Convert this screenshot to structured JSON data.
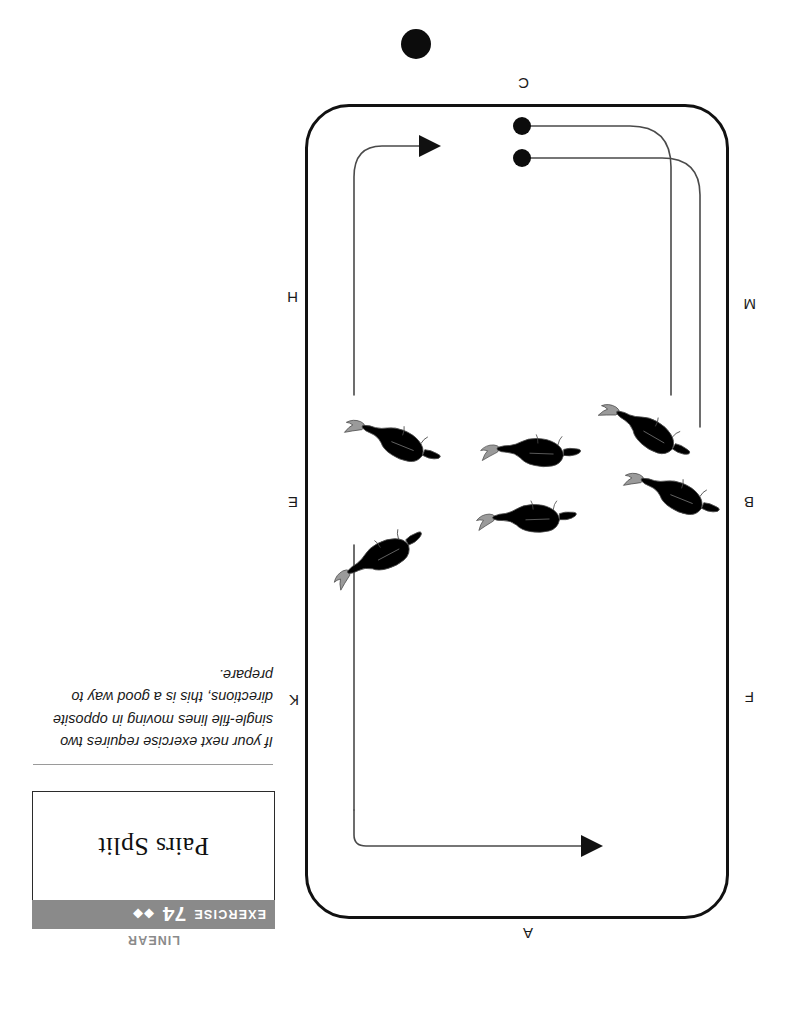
{
  "page": {
    "orientation": "rotated-180",
    "background": "#ffffff"
  },
  "header": {
    "category": "LINEAR",
    "exercise_word": "EXERCISE",
    "exercise_number": "74",
    "difficulty_diamonds": "◆◆",
    "band_color": "#8a8a8a",
    "category_color": "#8a8a8a"
  },
  "title": {
    "text": "Pairs Split"
  },
  "caption": {
    "text": "If your next exercise requires two single-file lines moving in opposite directions, this is a good way to prepare."
  },
  "arena": {
    "letters": [
      {
        "id": "A",
        "label": "A",
        "side": "top",
        "x": 253,
        "y": 74
      },
      {
        "id": "F",
        "label": "F",
        "side": "left",
        "x": 32,
        "y": 310
      },
      {
        "id": "B",
        "label": "B",
        "side": "left",
        "x": 32,
        "y": 505
      },
      {
        "id": "M",
        "label": "M",
        "side": "left",
        "x": 30,
        "y": 703
      },
      {
        "id": "K",
        "label": "K",
        "side": "right",
        "x": 487,
        "y": 307
      },
      {
        "id": "E",
        "label": "E",
        "side": "right",
        "x": 488,
        "y": 505
      },
      {
        "id": "H",
        "label": "H",
        "side": "right",
        "x": 488,
        "y": 710
      },
      {
        "id": "C",
        "label": "C",
        "side": "bottom",
        "x": 257,
        "y": 924
      }
    ],
    "border_color": "#111111"
  },
  "tracks": {
    "line_color": "#4a4a4a",
    "arrow_color": "#111111",
    "start_dot_color": "#0c0c0c",
    "arrows": [
      {
        "id": "arrow-top",
        "direction": "left",
        "x": 196,
        "y": 169
      },
      {
        "id": "arrow-bottom",
        "direction": "left",
        "x": 358,
        "y": 869
      }
    ],
    "start_dots": [
      {
        "id": "start-dot-inner",
        "x": 264,
        "y": 857
      },
      {
        "id": "start-dot-outer",
        "x": 264,
        "y": 889
      }
    ]
  },
  "horses": {
    "dark_color": "#8c8c8c",
    "light_color": "#d2d2d2",
    "outline_color": "#4a4a4a",
    "line_dark": {
      "label": "dark-gray-line",
      "count": 3
    },
    "line_light": {
      "label": "light-gray-line",
      "count": 3
    }
  },
  "page_marker": {
    "shape": "dot",
    "color": "#0c0c0c"
  }
}
